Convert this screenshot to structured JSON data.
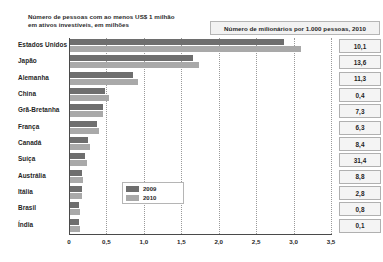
{
  "title": "Número de pessoas com ao menos US$ 1 milhão\nem ativos investíveis, em milhões",
  "header_box": {
    "label": "Número de milionários por 1.000 pessoas, 2010"
  },
  "legend": {
    "items": [
      {
        "label": "2009",
        "color": "#6e6e6e"
      },
      {
        "label": "2010",
        "color": "#a9a9a9"
      }
    ]
  },
  "colors": {
    "series_2009": "#6e6e6e",
    "series_2010": "#a9a9a9",
    "axis": "#4a4a4a",
    "grid": "#9a9a9a",
    "box_fill": "#f2f2f2",
    "box_border": "#b5b5b5"
  },
  "chart_data": {
    "type": "bar",
    "orientation": "horizontal",
    "title": "Número de pessoas com ao menos US$ 1 milhão em ativos investíveis, em milhões",
    "xlabel": "",
    "ylabel": "",
    "xlim": [
      0,
      3.5
    ],
    "grid": true,
    "legend_position": "inside-center",
    "xticks": [
      "0",
      "0,5",
      "1,0",
      "1,5",
      "2,0",
      "2,5",
      "3,0",
      "3,5"
    ],
    "xtick_values": [
      0,
      0.5,
      1.0,
      1.5,
      2.0,
      2.5,
      3.0,
      3.5
    ],
    "categories": [
      "Estados Unidos",
      "Japão",
      "Alemanha",
      "China",
      "Grã-Bretanha",
      "França",
      "Canadá",
      "Suíça",
      "Austrália",
      "Itália",
      "Brasil",
      "Índia"
    ],
    "series": [
      {
        "name": "2009",
        "values": [
          2.87,
          1.65,
          0.86,
          0.48,
          0.45,
          0.38,
          0.25,
          0.22,
          0.17,
          0.17,
          0.13,
          0.13
        ]
      },
      {
        "name": "2010",
        "values": [
          3.1,
          1.74,
          0.92,
          0.54,
          0.45,
          0.4,
          0.28,
          0.24,
          0.19,
          0.17,
          0.15,
          0.15
        ]
      }
    ],
    "side_values": {
      "header": "Número de milionários por 1.000 pessoas, 2010",
      "values": [
        "10,1",
        "13,6",
        "11,3",
        "0,4",
        "7,3",
        "6,3",
        "8,4",
        "31,4",
        "8,8",
        "2,8",
        "0,8",
        "0,1"
      ]
    }
  }
}
